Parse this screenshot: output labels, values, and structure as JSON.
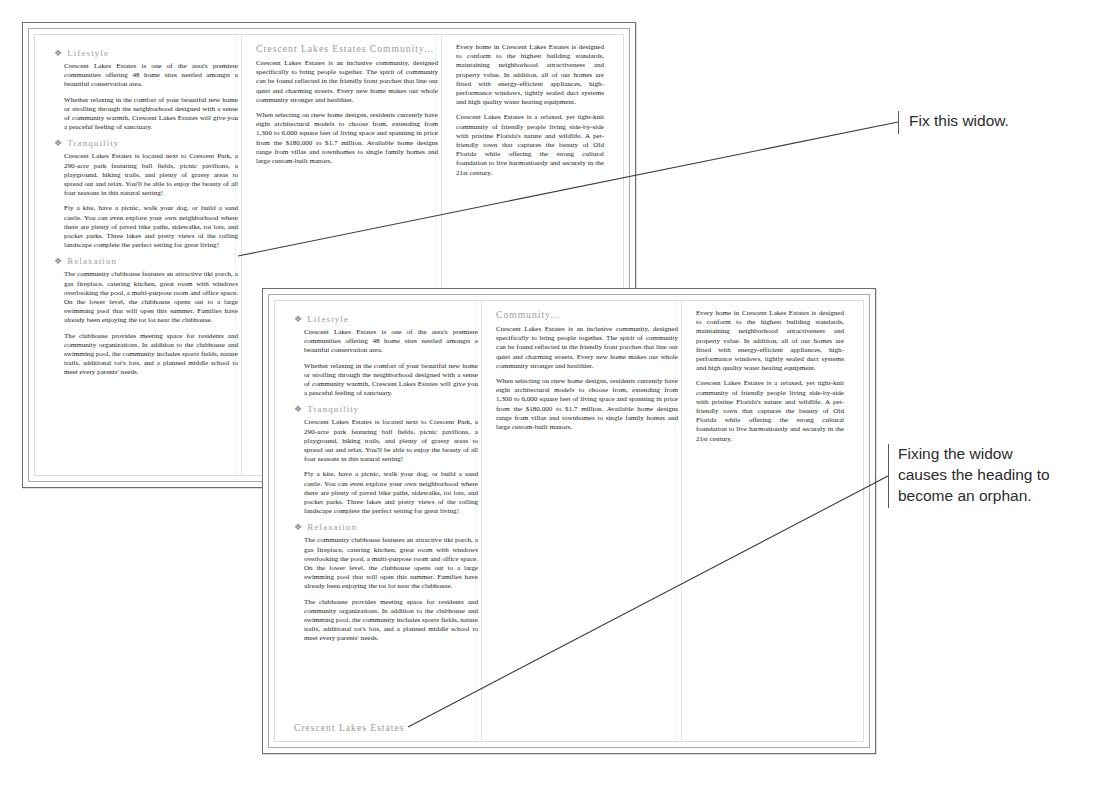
{
  "documents": [
    {
      "id": "doc1",
      "columns": [
        {
          "blocks": [
            {
              "type": "heading-accent",
              "bullet": "❖",
              "text": "Lifestyle"
            },
            {
              "type": "para",
              "text": "Crescent Lakes Estates is one of the area's premiere communities offering 48 home sites nestled amongst a beautiful conservation area."
            },
            {
              "type": "para",
              "text": "Whether relaxing in the comfort of your beautiful new home or strolling through the neighborhood designed with a sense of community warmth, Crescent Lakes Estates will give you a peaceful feeling of sanctuary."
            },
            {
              "type": "heading-accent",
              "bullet": "❖",
              "text": "Tranquility"
            },
            {
              "type": "para",
              "text": "Crescent Lakes Estates is located next to Crescent Park, a 290-acre park featuring ball fields, picnic pavilions, a playground, hiking trails, and plenty of grassy areas to spread out and relax. You'll be able to enjoy the beauty of all four seasons in this natural setting!"
            },
            {
              "type": "para",
              "text": "Fly a kite, have a picnic, walk your dog, or build a sand castle. You can even explore your own neighborhood where there are plenty of paved bike paths, sidewalks, tot lots, and pocket parks. Three lakes and pretty views of the rolling landscape complete the perfect setting for great living!"
            },
            {
              "type": "heading-accent",
              "bullet": "❖",
              "text": "Relaxation"
            },
            {
              "type": "para",
              "text": "The community clubhouse features an attractive tiki porch, a gas fireplace, catering kitchen, great room with windows overlooking the pool, a multi-purpose room and office space. On the lower level, the clubhouse opens out to a large swimming pool that will open this summer. Families have already been enjoying the tot lot near the clubhouse."
            },
            {
              "type": "para",
              "text": "The clubhouse provides meeting space for residents and community organizations. In addition to the clubhouse and swimming pool, the community includes sports fields, nature trails, additional tot's lots, and a planned middle school to meet every parents' needs."
            }
          ]
        },
        {
          "blocks": [
            {
              "type": "heading-section",
              "text": "Crescent Lakes Estates Community..."
            },
            {
              "type": "para",
              "text": "Crescent Lakes Estates is an inclusive community, designed specifically to bring people together. The spirit of community can be found reflected in the friendly front porches that line our quiet and charming streets. Every new home makes our whole community stronger and healthier."
            },
            {
              "type": "para",
              "text": "When selecting ou rnew home designs, residents currently have eight architectural models to choose from, extending from 1,300 to 6,000 square feet of living space and spanning in price from the $180,000 to $1.7 million. Available home designs range from villas and townhomes to single family homes and large custom-built manors."
            }
          ]
        },
        {
          "blocks": [
            {
              "type": "para",
              "text": "Every home in Crescent Lakes Estates is designed to conform to the highest building standards, maintaining neighborhood attractiveness and property value. In addition, all of our homes are fitted with energy-efficient appliances, high-performance windows, tightly sealed duct systems and high quality water heating equipment."
            },
            {
              "type": "para",
              "text": "Crescent Lakes Estates is a relaxed, yet tight-knit community of friendly people living side-by-side with pristine Florida's nature and wildlife. A pet-friendly town that captures the beauty of Old Florida while offering the strong cultural foundation to live harmoniously and securely in the 21st century."
            }
          ]
        }
      ]
    },
    {
      "id": "doc2",
      "orphan_footer": "Crescent Lakes Estates",
      "columns": [
        {
          "blocks": [
            {
              "type": "heading-accent",
              "bullet": "❖",
              "text": "Lifestyle"
            },
            {
              "type": "para",
              "text": "Crescent Lakes Estates is one of the area's premiere communities offering 48 home sites nestled amongst a beautiful conservation area."
            },
            {
              "type": "para",
              "text": "Whether relaxing in the comfort of your beautiful new home or strolling through the neighborhood designed with a sense of community warmth, Crescent Lakes Estates will give you a peaceful feeling of sanctuary."
            },
            {
              "type": "heading-accent",
              "bullet": "❖",
              "text": "Tranquility"
            },
            {
              "type": "para",
              "text": "Crescent Lakes Estates is located next to Crescent Park, a 290-acre park featuring ball fields, picnic pavilions, a playground, hiking trails, and plenty of grassy areas to spread out and relax. You'll be able to enjoy the beauty of all four seasons in this natural setting!"
            },
            {
              "type": "para",
              "text": "Fly a kite, have a picnic, walk your dog, or build a sand castle. You can even explore your own neighborhood where there are plenty of paved bike paths, sidewalks, tot lots, and pocket parks. Three lakes and pretty views of the rolling landscape complete the perfect setting for great living!"
            },
            {
              "type": "heading-accent",
              "bullet": "❖",
              "text": "Relaxation"
            },
            {
              "type": "para",
              "text": "The community clubhouse features an attractive tiki porch, a gas fireplace, catering kitchen, great room with windows overlooking the pool, a multi-purpose room and office space. On the lower level, the clubhouse opens out to a large swimming pool that will open this summer. Families have already been enjoying the tot lot near the clubhouse."
            },
            {
              "type": "para",
              "text": "The clubhouse provides meeting space for residents and community organizations. In addition to the clubhouse and swimming pool, the community includes sports fields, nature trails, additional tot's lots, and a planned middle school to meet every parents' needs."
            }
          ]
        },
        {
          "blocks": [
            {
              "type": "heading-section",
              "text": "Community..."
            },
            {
              "type": "para",
              "text": "Crescent Lakes Estates is an inclusive community, designed specifically to bring people together. The spirit of community can be found reflected in the friendly front porches that line our quiet and charming streets. Every new home makes our whole community stronger and healthier."
            },
            {
              "type": "para",
              "text": "When selecting ou rnew home designs, residents currently have eight architectural models to choose from, extending from 1,300 to 6,000 square feet of living space and spanning in price from the $180,000 to $1.7 million. Available home designs range from villas and townhomes to single family homes and large custom-built manors."
            }
          ]
        },
        {
          "blocks": [
            {
              "type": "para",
              "text": "Every home in Crescent Lakes Estates is designed to conform to the highest building standards, maintaining neighborhood attractiveness and property value. In addition, all of our homes are fitted with energy-efficient appliances, high-performance windows, tightly sealed duct systems and high quality water heating equipment."
            },
            {
              "type": "para",
              "text": "Crescent Lakes Estates is a relaxed, yet tight-knit community of friendly people living side-by-side with pristine Florida's nature and wildlife. A pet-friendly town that captures the beauty of Old Florida while offering the strong cultural foundation to live harmoniously and securely in the 21st century."
            }
          ]
        }
      ]
    }
  ],
  "annotations": {
    "top": "Fix this widow.",
    "bottom": "Fixing the widow\ncauses the heading to\nbecome an orphan."
  },
  "colors": {
    "heading": "#9a9a9a",
    "body_text": "#1b1b1b",
    "page_border": "#6f6f6f",
    "frame_border": "#dcdcdc",
    "annotation_text": "#2b2b2b",
    "leader_line": "#3a3a3a"
  }
}
